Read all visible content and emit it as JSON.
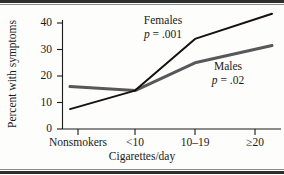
{
  "figure": {
    "background_color": "#fdfdfb",
    "rule_color": "#2e2e2e"
  },
  "chart_data": {
    "type": "line",
    "title": "",
    "xlabel": "Cigarettes/day",
    "ylabel": "Percent with symptoms",
    "categories": [
      "Nonsmokers",
      "<10",
      "10–19",
      "≥20"
    ],
    "xtick_labels": [
      "Nonsmokers",
      "<10",
      "10–19",
      "≥20"
    ],
    "ytick_labels": [
      "0",
      "10",
      "20",
      "30",
      "40"
    ],
    "ytick_values": [
      0,
      10,
      20,
      30,
      40
    ],
    "ylim": [
      0,
      46
    ],
    "grid": false,
    "legend": "annotations-inline",
    "series": [
      {
        "name": "Females",
        "color": "#15110f",
        "line_width": 2.0,
        "values": [
          7.5,
          14.5,
          34.0,
          43.5
        ],
        "annotation_label": "Females",
        "annotation_p": "p = .001"
      },
      {
        "name": "Males",
        "color": "#58575a",
        "line_width": 3.0,
        "values": [
          16.0,
          14.5,
          25.0,
          31.5
        ],
        "annotation_label": "Males",
        "annotation_p": "p = .02"
      }
    ],
    "annotations": [
      {
        "text": "Females",
        "sub": "p = .001"
      },
      {
        "text": "Males",
        "sub": "p = .02"
      }
    ]
  },
  "axes": {
    "y_label": "Percent with symptoms",
    "x_label": "Cigarettes/day",
    "y_ticks": [
      "0",
      "10",
      "20",
      "30",
      "40"
    ],
    "x_ticks": [
      "Nonsmokers",
      "<10",
      "10–19",
      "≥20"
    ]
  },
  "annotations": {
    "females": {
      "name": "Females",
      "p_prefix": "p",
      "p_eq": " = ",
      "p_value": ".001"
    },
    "males": {
      "name": "Males",
      "p_prefix": "p",
      "p_eq": " = ",
      "p_value": ".02"
    }
  }
}
